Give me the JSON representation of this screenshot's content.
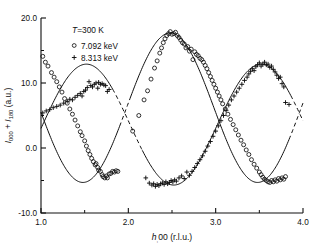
{
  "figure": {
    "background_color": "#ffffff",
    "ink_color": "#101010"
  },
  "annotations": {
    "temperature": "T=300 K",
    "legend_entries": [
      {
        "marker": "circle-marker",
        "symbol": "o",
        "label": "7.092 keV"
      },
      {
        "marker": "plus-marker",
        "symbol": "+",
        "label": "8.313 keV"
      }
    ]
  },
  "chart_data": {
    "type": "scatter",
    "title": "",
    "subtitle": "",
    "xlabel": "h,00 (r.l.u.)",
    "ylabel": "I₀₀₀ + I₁₈₀  (arb.)",
    "ylabel_parts": {
      "main": "I",
      "sub1": "000",
      "plus": " + ",
      "main2": "I",
      "sub2": "180",
      "unit": "(a.u.)"
    },
    "xlim": [
      1.0,
      4.0
    ],
    "ylim": [
      -10.0,
      20.0
    ],
    "xticks": [
      1.0,
      2.0,
      3.0,
      4.0
    ],
    "xticklabels": [
      "1.0",
      "2.0",
      "3.0",
      "4.0"
    ],
    "xminorticks": [
      1.5,
      2.5,
      3.5
    ],
    "yticks": [
      -10.0,
      0.0,
      10.0,
      20.0
    ],
    "yticklabels": [
      "-10.0",
      "0.0",
      "10.0",
      "20.0"
    ],
    "yminorticks": [
      -5.0,
      5.0,
      15.0
    ],
    "grid": false,
    "legend_position": "upper-left-inside",
    "series": [
      {
        "name": "7.092 keV",
        "marker": "circle",
        "curve_style": "solid-with-dashed-extension",
        "points": [
          [
            1.02,
            14.1
          ],
          [
            1.05,
            13.2
          ],
          [
            1.08,
            12.6
          ],
          [
            1.12,
            11.6
          ],
          [
            1.15,
            10.9
          ],
          [
            1.18,
            10.2
          ],
          [
            1.21,
            9.4
          ],
          [
            1.24,
            8.6
          ],
          [
            1.27,
            7.6
          ],
          [
            1.3,
            6.9
          ],
          [
            1.33,
            6.0
          ],
          [
            1.36,
            5.2
          ],
          [
            1.39,
            4.3
          ],
          [
            1.42,
            3.4
          ],
          [
            1.45,
            2.5
          ],
          [
            1.47,
            1.9
          ],
          [
            1.5,
            1.1
          ],
          [
            1.52,
            0.3
          ],
          [
            1.54,
            -0.4
          ],
          [
            1.56,
            -1.0
          ],
          [
            1.58,
            -1.6
          ],
          [
            1.6,
            -2.1
          ],
          [
            1.62,
            -2.6
          ],
          [
            1.63,
            -2.4
          ],
          [
            1.65,
            -3.0
          ],
          [
            1.66,
            -3.4
          ],
          [
            1.68,
            -3.6
          ],
          [
            1.7,
            -4.1
          ],
          [
            1.71,
            -4.4
          ],
          [
            1.73,
            -4.6
          ],
          [
            1.75,
            -4.3
          ],
          [
            1.76,
            -4.6
          ],
          [
            1.78,
            -4.0
          ],
          [
            1.8,
            -3.9
          ],
          [
            1.82,
            -3.6
          ],
          [
            1.84,
            -3.7
          ],
          [
            1.86,
            -3.5
          ],
          [
            1.88,
            -3.6
          ],
          [
            2.05,
            2.6
          ],
          [
            2.12,
            5.0
          ],
          [
            2.18,
            7.4
          ],
          [
            2.22,
            8.8
          ],
          [
            2.26,
            10.6
          ],
          [
            2.3,
            12.3
          ],
          [
            2.33,
            13.4
          ],
          [
            2.36,
            14.6
          ],
          [
            2.38,
            15.4
          ],
          [
            2.4,
            16.2
          ],
          [
            2.42,
            16.8
          ],
          [
            2.44,
            17.3
          ],
          [
            2.46,
            17.6
          ],
          [
            2.48,
            17.9
          ],
          [
            2.5,
            17.5
          ],
          [
            2.52,
            17.6
          ],
          [
            2.54,
            17.8
          ],
          [
            2.56,
            17.3
          ],
          [
            2.58,
            17.0
          ],
          [
            2.6,
            16.6
          ],
          [
            2.62,
            16.2
          ],
          [
            2.64,
            16.0
          ],
          [
            2.66,
            15.4
          ],
          [
            2.68,
            15.6
          ],
          [
            2.7,
            14.9
          ],
          [
            2.72,
            15.2
          ],
          [
            2.74,
            13.6
          ],
          [
            2.76,
            14.8
          ],
          [
            2.78,
            14.4
          ],
          [
            2.8,
            14.2
          ],
          [
            2.82,
            13.8
          ],
          [
            2.84,
            13.6
          ],
          [
            2.86,
            13.2
          ],
          [
            2.88,
            12.7
          ],
          [
            2.9,
            12.2
          ],
          [
            2.92,
            11.6
          ],
          [
            2.94,
            11.0
          ],
          [
            2.96,
            10.4
          ],
          [
            2.98,
            9.8
          ],
          [
            3.0,
            9.2
          ],
          [
            3.02,
            8.6
          ],
          [
            3.04,
            8.0
          ],
          [
            3.06,
            7.4
          ],
          [
            3.08,
            6.8
          ],
          [
            3.11,
            6.0
          ],
          [
            3.14,
            5.2
          ],
          [
            3.17,
            4.4
          ],
          [
            3.2,
            3.6
          ],
          [
            3.23,
            2.8
          ],
          [
            3.26,
            2.0
          ],
          [
            3.29,
            1.2
          ],
          [
            3.32,
            0.5
          ],
          [
            3.35,
            -0.3
          ],
          [
            3.38,
            -1.0
          ],
          [
            3.41,
            -1.8
          ],
          [
            3.44,
            -2.5
          ],
          [
            3.47,
            -3.1
          ],
          [
            3.5,
            -3.7
          ],
          [
            3.52,
            -4.1
          ],
          [
            3.54,
            -4.5
          ],
          [
            3.56,
            -4.8
          ],
          [
            3.58,
            -5.0
          ],
          [
            3.6,
            -5.2
          ],
          [
            3.62,
            -5.3
          ],
          [
            3.64,
            -5.0
          ],
          [
            3.66,
            -5.2
          ],
          [
            3.68,
            -4.9
          ],
          [
            3.7,
            -5.1
          ],
          [
            3.72,
            -4.7
          ],
          [
            3.74,
            -4.9
          ],
          [
            3.76,
            -4.6
          ],
          [
            3.78,
            -4.8
          ],
          [
            3.8,
            -4.4
          ]
        ]
      },
      {
        "name": "8.313 keV",
        "marker": "plus",
        "curve_style": "solid-with-dashed-extension",
        "points": [
          [
            1.02,
            5.4
          ],
          [
            1.06,
            5.7
          ],
          [
            1.1,
            5.9
          ],
          [
            1.14,
            6.2
          ],
          [
            1.18,
            6.4
          ],
          [
            1.22,
            6.6
          ],
          [
            1.26,
            6.9
          ],
          [
            1.3,
            7.2
          ],
          [
            1.33,
            7.5
          ],
          [
            1.36,
            7.4
          ],
          [
            1.39,
            7.8
          ],
          [
            1.42,
            8.1
          ],
          [
            1.45,
            8.4
          ],
          [
            1.47,
            8.0
          ],
          [
            1.49,
            8.7
          ],
          [
            1.51,
            8.9
          ],
          [
            1.53,
            9.3
          ],
          [
            1.55,
            10.2
          ],
          [
            1.57,
            9.6
          ],
          [
            1.59,
            9.4
          ],
          [
            1.61,
            9.8
          ],
          [
            1.63,
            10.0
          ],
          [
            1.65,
            9.2
          ],
          [
            1.66,
            10.1
          ],
          [
            1.68,
            9.8
          ],
          [
            1.7,
            9.9
          ],
          [
            1.72,
            9.7
          ],
          [
            1.74,
            9.6
          ],
          [
            1.76,
            8.7
          ],
          [
            1.78,
            9.0
          ],
          [
            2.2,
            -4.6
          ],
          [
            2.24,
            -5.4
          ],
          [
            2.27,
            -5.7
          ],
          [
            2.29,
            -5.5
          ],
          [
            2.31,
            -5.9
          ],
          [
            2.33,
            -5.6
          ],
          [
            2.35,
            -5.8
          ],
          [
            2.37,
            -5.5
          ],
          [
            2.39,
            -5.4
          ],
          [
            2.41,
            -5.6
          ],
          [
            2.43,
            -5.2
          ],
          [
            2.45,
            -5.5
          ],
          [
            2.47,
            -5.3
          ],
          [
            2.49,
            -5.0
          ],
          [
            2.51,
            -5.2
          ],
          [
            2.53,
            -4.9
          ],
          [
            2.55,
            -5.1
          ],
          [
            2.58,
            -4.6
          ],
          [
            2.61,
            -4.3
          ],
          [
            2.64,
            -4.7
          ],
          [
            2.67,
            -3.7
          ],
          [
            2.7,
            -4.2
          ],
          [
            2.73,
            -3.6
          ],
          [
            2.76,
            -3.0
          ],
          [
            2.79,
            -2.4
          ],
          [
            2.82,
            -1.8
          ],
          [
            2.85,
            -1.2
          ],
          [
            2.88,
            -0.5
          ],
          [
            2.91,
            0.3
          ],
          [
            2.94,
            1.0
          ],
          [
            2.97,
            1.8
          ],
          [
            3.0,
            2.6
          ],
          [
            3.03,
            3.4
          ],
          [
            3.06,
            4.2
          ],
          [
            3.09,
            5.0
          ],
          [
            3.12,
            5.8
          ],
          [
            3.15,
            6.6
          ],
          [
            3.18,
            7.4
          ],
          [
            3.21,
            8.0
          ],
          [
            3.24,
            8.6
          ],
          [
            3.27,
            9.2
          ],
          [
            3.3,
            9.8
          ],
          [
            3.33,
            10.4
          ],
          [
            3.36,
            10.9
          ],
          [
            3.38,
            11.4
          ],
          [
            3.4,
            11.8
          ],
          [
            3.42,
            12.2
          ],
          [
            3.44,
            11.9
          ],
          [
            3.46,
            12.5
          ],
          [
            3.48,
            12.8
          ],
          [
            3.5,
            13.1
          ],
          [
            3.52,
            12.6
          ],
          [
            3.54,
            12.9
          ],
          [
            3.56,
            13.2
          ],
          [
            3.58,
            12.8
          ],
          [
            3.6,
            12.9
          ],
          [
            3.62,
            12.4
          ],
          [
            3.64,
            12.6
          ],
          [
            3.66,
            12.1
          ],
          [
            3.68,
            11.7
          ],
          [
            3.7,
            11.2
          ],
          [
            3.72,
            10.7
          ],
          [
            3.74,
            10.9
          ],
          [
            3.76,
            9.9
          ],
          [
            3.78,
            9.4
          ],
          [
            3.8,
            7.0
          ],
          [
            3.84,
            6.7
          ]
        ]
      }
    ],
    "fit_curves": [
      {
        "name": "fit-7.092",
        "style": "sine-like",
        "description": "solid through circle data, dashed where no data",
        "amplitude": 11.5,
        "offset": 6.2,
        "period": 2.0,
        "phase_peak": 2.48
      },
      {
        "name": "fit-8.313",
        "style": "sine-like",
        "description": "solid through plus data, dashed where no data",
        "amplitude": 9.3,
        "offset": 3.6,
        "period": 2.0,
        "phase_peak": 3.52
      }
    ]
  }
}
